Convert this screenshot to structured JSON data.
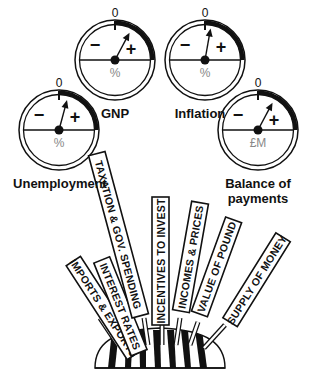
{
  "diagram": {
    "gauges": [
      {
        "id": "gnp",
        "label": "GNP",
        "zero": "0",
        "minus": "−",
        "plus": "+",
        "unit": "%",
        "cx": 115,
        "cy": 60,
        "needle_deg": 28
      },
      {
        "id": "inflation",
        "label": "Inflation",
        "zero": "0",
        "minus": "−",
        "plus": "+",
        "unit": "%",
        "cx": 205,
        "cy": 60,
        "needle_deg": 10
      },
      {
        "id": "unemployment",
        "label": "Unemployment",
        "zero": "0",
        "minus": "−",
        "plus": "+",
        "unit": "%",
        "cx": 59,
        "cy": 130,
        "needle_deg": 15
      },
      {
        "id": "balance-of-payments",
        "label_line1": "Balance of",
        "label_line2": "payments",
        "zero": "0",
        "minus": "−",
        "plus": "+",
        "unit": "£M",
        "cx": 258,
        "cy": 130,
        "needle_deg": 28
      }
    ],
    "levers": [
      {
        "label": "IMPORTS & EXPORTS"
      },
      {
        "label": "INTEREST RATES"
      },
      {
        "label": "TAXATION & GOV. SPENDING"
      },
      {
        "label": "INCENTIVES TO INVEST"
      },
      {
        "label": "INCOMES & PRICES"
      },
      {
        "label": "VALUE OF POUND"
      },
      {
        "label": "SUPPLY OF MONEY"
      }
    ],
    "colors": {
      "ink": "#111111",
      "unit_grey": "#888888",
      "background": "#ffffff"
    }
  }
}
